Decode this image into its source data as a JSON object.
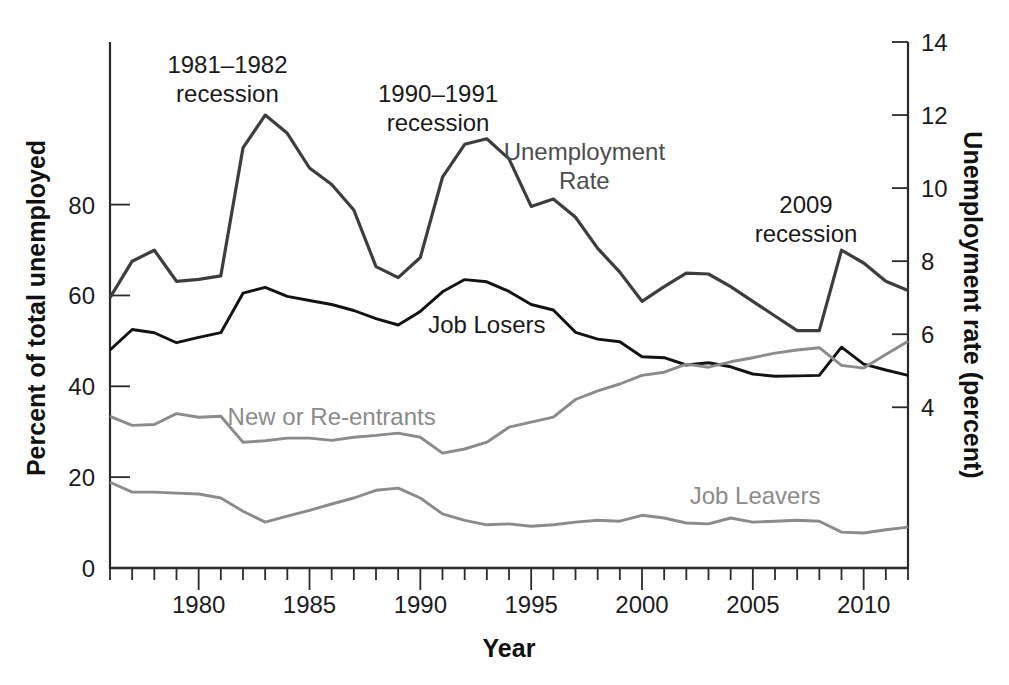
{
  "figure": {
    "background": "#ffffff",
    "axis_color": "#2a2a2a",
    "tick_label_color": "#1c1c1c"
  },
  "chart_data": {
    "type": "line",
    "title": "",
    "xlabel": "Year",
    "ylabel_left": "Percent of total unemployed",
    "ylabel_right": "Unemployment rate (percent)",
    "grid": false,
    "legend": "inline-labels",
    "x": [
      1976,
      1977,
      1978,
      1979,
      1980,
      1981,
      1982,
      1983,
      1984,
      1985,
      1986,
      1987,
      1988,
      1989,
      1990,
      1991,
      1992,
      1993,
      1994,
      1995,
      1996,
      1997,
      1998,
      1999,
      2000,
      2001,
      2002,
      2003,
      2004,
      2005,
      2006,
      2007,
      2008,
      2009,
      2010,
      2011,
      2012
    ],
    "xlim": [
      1976,
      2012
    ],
    "x_ticks": [
      1980,
      1985,
      1990,
      1995,
      2000,
      2005,
      2010
    ],
    "left_axis": {
      "range": [
        0,
        115.8
      ],
      "ticks": [
        0,
        20,
        40,
        60,
        80
      ]
    },
    "right_axis": {
      "range": [
        -0.4,
        14
      ],
      "ticks": [
        4,
        6,
        8,
        10,
        12,
        14
      ]
    },
    "series": [
      {
        "name": "Unemployment Rate",
        "axis": "right",
        "color": "#3d3d3d",
        "stroke_width": 3.2,
        "values": [
          7.0,
          8.0,
          8.3,
          7.45,
          7.5,
          7.6,
          11.1,
          12.0,
          11.5,
          10.55,
          10.1,
          9.4,
          7.85,
          7.55,
          8.1,
          10.3,
          11.2,
          11.35,
          10.8,
          9.5,
          9.7,
          9.2,
          8.35,
          7.7,
          6.9,
          7.3,
          7.67,
          7.65,
          7.3,
          6.9,
          6.5,
          6.1,
          6.1,
          8.3,
          7.95,
          7.45,
          7.2
        ]
      },
      {
        "name": "Job Losers",
        "axis": "left",
        "color": "#121212",
        "stroke_width": 2.9,
        "values": [
          48.0,
          52.5,
          51.8,
          49.6,
          50.8,
          51.8,
          60.5,
          61.8,
          59.8,
          58.9,
          58.0,
          56.7,
          54.9,
          53.5,
          56.5,
          60.8,
          63.5,
          63.0,
          60.9,
          58.0,
          56.8,
          51.9,
          50.4,
          49.8,
          46.5,
          46.3,
          44.7,
          45.2,
          44.3,
          42.7,
          42.2,
          42.3,
          42.4,
          48.6,
          44.9,
          43.6,
          42.4
        ]
      },
      {
        "name": "New or Re-entrants",
        "axis": "left",
        "color": "#8b8b8b",
        "stroke_width": 2.9,
        "values": [
          33.4,
          31.4,
          31.6,
          34.0,
          33.2,
          33.4,
          27.7,
          28.0,
          28.6,
          28.6,
          28.1,
          28.8,
          29.2,
          29.7,
          28.8,
          25.3,
          26.2,
          27.7,
          31.0,
          32.1,
          33.2,
          37.1,
          39.0,
          40.5,
          42.4,
          43.1,
          44.9,
          44.2,
          45.4,
          46.3,
          47.3,
          48.0,
          48.5,
          44.6,
          44.0,
          47.0,
          49.9
        ]
      },
      {
        "name": "Job Leavers",
        "axis": "left",
        "color": "#8b8b8b",
        "stroke_width": 2.9,
        "values": [
          18.9,
          16.7,
          16.7,
          16.5,
          16.3,
          15.4,
          12.5,
          10.1,
          11.4,
          12.7,
          14.1,
          15.4,
          17.1,
          17.6,
          15.4,
          11.9,
          10.5,
          9.5,
          9.7,
          9.2,
          9.5,
          10.1,
          10.5,
          10.3,
          11.6,
          11.0,
          9.9,
          9.7,
          11.0,
          10.1,
          10.3,
          10.5,
          10.3,
          7.9,
          7.7,
          8.4,
          9.0
        ]
      }
    ],
    "annotations": [
      {
        "text": "1981–1982\nrecession",
        "year": 1981.3,
        "value": 13.0,
        "axis": "right",
        "color": "#1a1a1a"
      },
      {
        "text": "1990–1991\nrecession",
        "year": 1990.8,
        "value": 12.2,
        "axis": "right",
        "color": "#1a1a1a"
      },
      {
        "text": "Unemployment\nRate",
        "year": 1997.4,
        "value": 10.6,
        "axis": "right",
        "color": "#4d4d4d"
      },
      {
        "text": "2009\nrecession",
        "year": 2007.4,
        "value": 9.15,
        "axis": "right",
        "color": "#1a1a1a"
      },
      {
        "text": "Job Losers",
        "year": 1993.0,
        "value": 53.8,
        "axis": "left",
        "color": "#1a1a1a"
      },
      {
        "text": "New or Re-entrants",
        "year": 1986.0,
        "value": 33.4,
        "axis": "left",
        "color": "#8b8b8b"
      },
      {
        "text": "Job Leavers",
        "year": 2005.1,
        "value": 16.0,
        "axis": "left",
        "color": "#8b8b8b"
      }
    ]
  }
}
